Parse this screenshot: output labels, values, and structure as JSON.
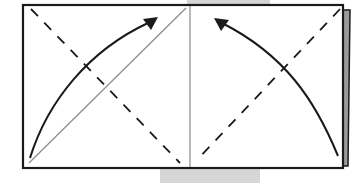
{
  "diagram": {
    "type": "origami-fold-instruction",
    "colors": {
      "outline": "#1a1a1a",
      "crease": "#8a8a8a",
      "shadow_tab": "#d4d4d4",
      "edge_shadow": "#7a7a7a",
      "paper": "#ffffff"
    },
    "elements": {
      "paper": "rectangle",
      "center_crease": "vertical thin line",
      "left_fold_line": "dashed diagonal (top-left to bottom-center)",
      "right_fold_line": "dashed diagonal (top-right to bottom-center)",
      "left_reference_crease": "thin diagonal (bottom-left to top-center)",
      "left_arrow": "curved arrow from bottom-left corner toward top",
      "right_arrow": "curved arrow from bottom-right corner toward top-center"
    }
  }
}
